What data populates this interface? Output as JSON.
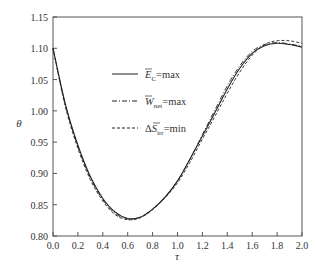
{
  "chart_data": {
    "type": "line",
    "title": "",
    "xlabel": "τ",
    "ylabel": "θ",
    "xlim": [
      0.0,
      2.0
    ],
    "ylim": [
      0.8,
      1.15
    ],
    "grid": false,
    "legend_position": "upper-left-inside",
    "xticks": [
      "0.0",
      "0.2",
      "0.4",
      "0.6",
      "0.8",
      "1.0",
      "1.2",
      "1.4",
      "1.6",
      "1.8",
      "2.0"
    ],
    "yticks": [
      "0.80",
      "0.85",
      "0.90",
      "0.95",
      "1.00",
      "1.05",
      "1.10",
      "1.15"
    ],
    "x": [
      0.0,
      0.1,
      0.2,
      0.3,
      0.4,
      0.5,
      0.6,
      0.7,
      0.8,
      0.9,
      1.0,
      1.1,
      1.2,
      1.3,
      1.4,
      1.5,
      1.6,
      1.7,
      1.8,
      1.9,
      2.0
    ],
    "series": [
      {
        "name": "Ē_C=max",
        "style": "solid",
        "values": [
          1.1,
          1.01,
          0.945,
          0.895,
          0.86,
          0.838,
          0.828,
          0.83,
          0.843,
          0.862,
          0.888,
          0.923,
          0.96,
          0.997,
          1.035,
          1.068,
          1.092,
          1.104,
          1.108,
          1.106,
          1.102
        ]
      },
      {
        "name": "W̄_net=max",
        "style": "dashdot",
        "values": [
          1.1,
          1.008,
          0.943,
          0.893,
          0.858,
          0.836,
          0.827,
          0.83,
          0.843,
          0.862,
          0.888,
          0.923,
          0.962,
          1.001,
          1.04,
          1.072,
          1.095,
          1.106,
          1.109,
          1.107,
          1.103
        ]
      },
      {
        "name": "ΔS̄_irr=min",
        "style": "dashed",
        "values": [
          1.1,
          1.006,
          0.94,
          0.89,
          0.856,
          0.834,
          0.826,
          0.829,
          0.842,
          0.861,
          0.885,
          0.918,
          0.955,
          0.991,
          1.028,
          1.062,
          1.089,
          1.106,
          1.112,
          1.112,
          1.108
        ]
      }
    ]
  },
  "legend": {
    "items": [
      {
        "main": "E",
        "sub": "C",
        "suffix": "=max",
        "prefix": ""
      },
      {
        "main": "W",
        "sub": "net",
        "suffix": "=max",
        "prefix": ""
      },
      {
        "main": "S",
        "sub": "irr",
        "suffix": "=min",
        "prefix": "Δ"
      }
    ]
  },
  "axes": {
    "x_label": "τ",
    "y_label": "θ"
  }
}
